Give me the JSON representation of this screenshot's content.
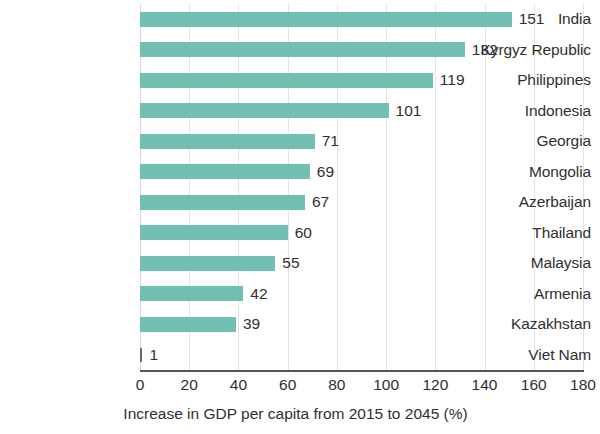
{
  "chart_data": {
    "type": "bar",
    "orientation": "horizontal",
    "title": "",
    "xlabel": "Increase in GDP per capita from 2015 to 2045 (%)",
    "ylabel": "",
    "xlim": [
      0,
      180
    ],
    "xticks": [
      0,
      20,
      40,
      60,
      80,
      100,
      120,
      140,
      160,
      180
    ],
    "xtick_labels": [
      "0",
      "20",
      "40",
      "60",
      "80",
      "100",
      "120",
      "140",
      "160",
      "180"
    ],
    "grid": true,
    "grid_axis": "x",
    "legend": false,
    "data_labels": true,
    "bar_color": "#74bfb3",
    "text_color": "#2f2f2f",
    "background": "#ffffff",
    "categories": [
      "India",
      "Kyrgyz Republic",
      "Philippines",
      "Indonesia",
      "Georgia",
      "Mongolia",
      "Azerbaijan",
      "Thailand",
      "Malaysia",
      "Armenia",
      "Kazakhstan",
      "Viet Nam"
    ],
    "values": [
      151,
      132,
      119,
      101,
      71,
      69,
      67,
      60,
      55,
      42,
      39,
      1
    ],
    "value_labels": [
      "151",
      "132",
      "119",
      "101",
      "71",
      "69",
      "67",
      "60",
      "55",
      "42",
      "39",
      "1"
    ]
  }
}
